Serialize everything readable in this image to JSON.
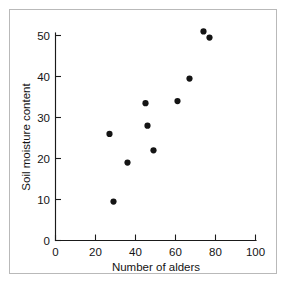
{
  "figure": {
    "kind": "scatter-plot",
    "background_color": "#ffffff",
    "frame_color": "#b9b9b9",
    "ink_color": "#141414"
  },
  "chart_data": {
    "type": "scatter",
    "title": "",
    "xlabel": "Number of alders",
    "ylabel": "Soil moisture content",
    "xlim": [
      0,
      100
    ],
    "ylim": [
      0,
      52
    ],
    "xticks": [
      0,
      20,
      40,
      60,
      80,
      100
    ],
    "yticks": [
      0,
      10,
      20,
      30,
      40,
      50
    ],
    "xtick_labels": [
      "0",
      "20",
      "40",
      "60",
      "80",
      "100"
    ],
    "ytick_labels": [
      "0",
      "10",
      "20",
      "30",
      "40",
      "50"
    ],
    "grid": false,
    "legend": false,
    "legend_position": "none",
    "marker": "filled-circle",
    "marker_color": "#141414",
    "marker_size": 5,
    "n_points": 10,
    "x": [
      27,
      29,
      36,
      45,
      46,
      49,
      61,
      67,
      74,
      77
    ],
    "y": [
      26,
      9.5,
      19,
      33.5,
      28,
      22,
      34,
      39.5,
      51,
      49.5
    ],
    "points": [
      {
        "x": 27,
        "y": 26
      },
      {
        "x": 29,
        "y": 9.5
      },
      {
        "x": 36,
        "y": 19
      },
      {
        "x": 45,
        "y": 33.5
      },
      {
        "x": 46,
        "y": 28
      },
      {
        "x": 49,
        "y": 22
      },
      {
        "x": 61,
        "y": 34
      },
      {
        "x": 67,
        "y": 39.5
      },
      {
        "x": 74,
        "y": 51
      },
      {
        "x": 77,
        "y": 49.5
      }
    ]
  }
}
